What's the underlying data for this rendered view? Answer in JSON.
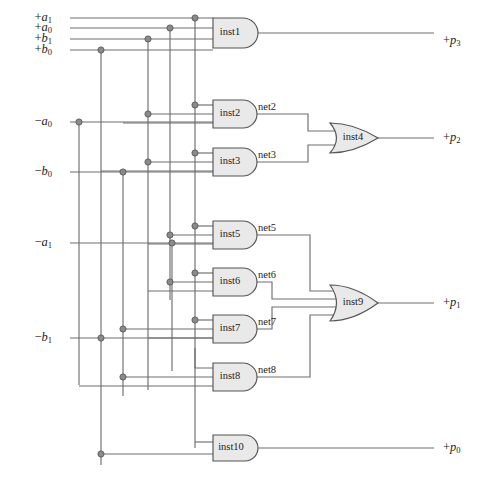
{
  "diagram": {
    "type": "logic-circuit-schematic",
    "width": 484,
    "height": 482,
    "colors": {
      "background": "#ffffff",
      "wire": "#6e6e6e",
      "gate_fill": "#e9e9e9",
      "gate_stroke": "#555555",
      "junction": "#8a8a8a",
      "text": "#1c1c1c"
    }
  },
  "inputs": [
    {
      "id": "in_pa1",
      "sign": "+",
      "base": "a",
      "sub": "1",
      "text": "+a1",
      "x": 52,
      "y": 18
    },
    {
      "id": "in_pa0",
      "sign": "+",
      "base": "a",
      "sub": "0",
      "text": "+a0",
      "x": 52,
      "y": 28
    },
    {
      "id": "in_pb1",
      "sign": "+",
      "base": "b",
      "sub": "1",
      "text": "+b1",
      "x": 52,
      "y": 39
    },
    {
      "id": "in_pb0",
      "sign": "+",
      "base": "b",
      "sub": "0",
      "text": "+b0",
      "x": 52,
      "y": 50
    },
    {
      "id": "in_na0",
      "sign": "−",
      "base": "a",
      "sub": "0",
      "text": "-a0",
      "x": 52,
      "y": 122
    },
    {
      "id": "in_nb0",
      "sign": "−",
      "base": "b",
      "sub": "0",
      "text": "-b0",
      "x": 52,
      "y": 172
    },
    {
      "id": "in_na1",
      "sign": "−",
      "base": "a",
      "sub": "1",
      "text": "-a1",
      "x": 52,
      "y": 243
    },
    {
      "id": "in_nb1",
      "sign": "−",
      "base": "b",
      "sub": "1",
      "text": "-b1",
      "x": 52,
      "y": 338
    }
  ],
  "outputs": [
    {
      "id": "out_p3",
      "sign": "+",
      "base": "p",
      "sub": "3",
      "text": "+p3",
      "x": 443,
      "y": 41
    },
    {
      "id": "out_p2",
      "sign": "+",
      "base": "p",
      "sub": "2",
      "text": "+p2",
      "x": 443,
      "y": 138
    },
    {
      "id": "out_p1",
      "sign": "+",
      "base": "p",
      "sub": "1",
      "text": "+p1",
      "x": 443,
      "y": 303
    },
    {
      "id": "out_p0",
      "sign": "+",
      "base": "p",
      "sub": "0",
      "text": "+p0",
      "x": 443,
      "y": 448
    }
  ],
  "gates": [
    {
      "id": "inst1",
      "label": "inst1",
      "kind": "and",
      "inputs": 4,
      "x": 213,
      "y": 18,
      "w": 30,
      "h": 30,
      "cy": 33,
      "out_x": 252
    },
    {
      "id": "inst2",
      "label": "inst2",
      "kind": "and",
      "inputs": 3,
      "x": 213,
      "y": 100,
      "w": 30,
      "h": 28,
      "cy": 114,
      "out_x": 252
    },
    {
      "id": "inst3",
      "label": "inst3",
      "kind": "and",
      "inputs": 3,
      "x": 213,
      "y": 148,
      "w": 30,
      "h": 28,
      "cy": 162,
      "out_x": 252
    },
    {
      "id": "inst4",
      "label": "inst4",
      "kind": "or",
      "inputs": 2,
      "x": 330,
      "y": 123,
      "w": 38,
      "h": 30,
      "cy": 138,
      "out_x": 378
    },
    {
      "id": "inst5",
      "label": "inst5",
      "kind": "and",
      "inputs": 3,
      "x": 213,
      "y": 221,
      "w": 30,
      "h": 28,
      "cy": 235,
      "out_x": 252
    },
    {
      "id": "inst6",
      "label": "inst6",
      "kind": "and",
      "inputs": 3,
      "x": 213,
      "y": 268,
      "w": 30,
      "h": 28,
      "cy": 282,
      "out_x": 252
    },
    {
      "id": "inst7",
      "label": "inst7",
      "kind": "and",
      "inputs": 3,
      "x": 213,
      "y": 315,
      "w": 30,
      "h": 28,
      "cy": 329,
      "out_x": 252
    },
    {
      "id": "inst8",
      "label": "inst8",
      "kind": "and",
      "inputs": 3,
      "x": 213,
      "y": 363,
      "w": 30,
      "h": 28,
      "cy": 377,
      "out_x": 252
    },
    {
      "id": "inst9",
      "label": "inst9",
      "kind": "or",
      "inputs": 4,
      "x": 330,
      "y": 285,
      "w": 38,
      "h": 36,
      "cy": 303,
      "out_x": 378
    },
    {
      "id": "inst10",
      "label": "inst10",
      "kind": "and",
      "inputs": 2,
      "x": 213,
      "y": 435,
      "w": 32,
      "h": 26,
      "cy": 448,
      "out_x": 254
    }
  ],
  "nets": [
    {
      "id": "net2",
      "label": "net2",
      "x": 258,
      "y": 108
    },
    {
      "id": "net3",
      "label": "net3",
      "x": 258,
      "y": 156
    },
    {
      "id": "net5",
      "label": "net5",
      "x": 258,
      "y": 229
    },
    {
      "id": "net6",
      "label": "net6",
      "x": 258,
      "y": 276
    },
    {
      "id": "net7",
      "label": "net7",
      "x": 258,
      "y": 323
    },
    {
      "id": "net8",
      "label": "net8",
      "x": 258,
      "y": 371
    }
  ],
  "buses": [
    {
      "id": "bus_pa1",
      "x": 195,
      "source": "+a1"
    },
    {
      "id": "bus_pa0",
      "x": 170,
      "source": "+a0"
    },
    {
      "id": "bus_pb1",
      "x": 148,
      "source": "+b1"
    },
    {
      "id": "bus_pb0",
      "x": 101,
      "source": "+b0"
    },
    {
      "id": "bus_na0",
      "x": 79,
      "source": "-a0"
    },
    {
      "id": "bus_nb0",
      "x": 123,
      "source": "-b0"
    },
    {
      "id": "bus_na1",
      "x": 172,
      "source": "-a1"
    },
    {
      "id": "bus_nb1",
      "x": 101,
      "source": "-b1"
    }
  ]
}
